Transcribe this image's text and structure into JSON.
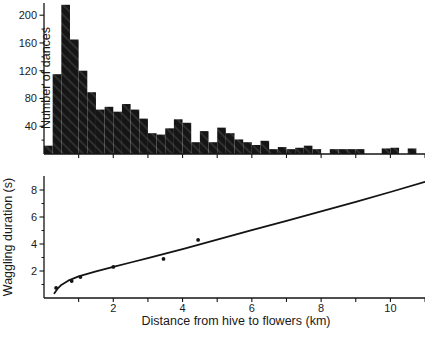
{
  "figure": {
    "background": "#ffffff",
    "ink_color": "#141414",
    "bar_fill": "#151515",
    "bar_hatch": "#3a3a3a"
  },
  "chart_data": [
    {
      "id": "dance-histogram",
      "type": "bar",
      "title": "",
      "xlabel": "",
      "ylabel": "Number of dances",
      "xlim": [
        0,
        11
      ],
      "ylim": [
        0,
        220
      ],
      "grid": false,
      "ytick_labels": [
        40,
        80,
        120,
        160,
        200
      ],
      "ytick_minor": [
        20,
        60,
        100,
        140,
        180
      ],
      "xtick_step_km": 1,
      "bin_width_km": 0.25,
      "bin_start_km": 0.0,
      "values": [
        12,
        115,
        215,
        165,
        120,
        89,
        64,
        68,
        61,
        72,
        64,
        51,
        30,
        28,
        37,
        50,
        45,
        17,
        33,
        17,
        38,
        30,
        21,
        17,
        13,
        19,
        7,
        10,
        7,
        9,
        12,
        7,
        0,
        7,
        7,
        7,
        7,
        0,
        0,
        8,
        9,
        0,
        8
      ]
    },
    {
      "id": "waggle-duration-plot",
      "type": "scatter",
      "title": "",
      "xlabel": "Distance from hive to flowers (km)",
      "ylabel": "Waggling duration (s)",
      "xlim": [
        0,
        11
      ],
      "ylim": [
        0,
        9
      ],
      "grid": false,
      "xtick_labels": [
        2,
        4,
        6,
        8,
        10
      ],
      "xtick_step_km": 1,
      "ytick_labels": [
        2,
        4,
        6,
        8
      ],
      "ytick_minor": [
        1,
        3,
        5,
        7
      ],
      "legend": null,
      "points": [
        [
          0.35,
          0.75
        ],
        [
          0.8,
          1.25
        ],
        [
          1.05,
          1.55
        ],
        [
          2.0,
          2.3
        ],
        [
          3.45,
          2.9
        ],
        [
          4.45,
          4.3
        ]
      ],
      "curve": [
        [
          0.3,
          0.35
        ],
        [
          0.4,
          0.72
        ],
        [
          0.5,
          0.97
        ],
        [
          0.7,
          1.28
        ],
        [
          1.0,
          1.6
        ],
        [
          1.5,
          1.97
        ],
        [
          2.0,
          2.3
        ],
        [
          2.5,
          2.63
        ],
        [
          3.0,
          2.95
        ],
        [
          3.5,
          3.28
        ],
        [
          4.0,
          3.62
        ],
        [
          5.0,
          4.32
        ],
        [
          6.0,
          5.02
        ],
        [
          7.0,
          5.72
        ],
        [
          8.0,
          6.42
        ],
        [
          9.0,
          7.12
        ],
        [
          10.0,
          7.85
        ],
        [
          11.0,
          8.6
        ]
      ]
    }
  ]
}
